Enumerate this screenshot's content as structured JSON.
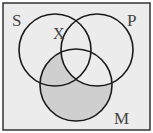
{
  "diagram": {
    "type": "venn",
    "sets": [
      {
        "label": "S",
        "cx": 55,
        "cy": 50,
        "r": 36
      },
      {
        "label": "P",
        "cx": 97,
        "cy": 50,
        "r": 36
      },
      {
        "label": "M",
        "cx": 76,
        "cy": 85,
        "r": 36
      }
    ],
    "labels": {
      "s": "S",
      "p": "P",
      "m": "M",
      "x": "X"
    },
    "shaded_region": "M minus P",
    "colors": {
      "background": "#ececec",
      "shade": "#cfcfcf",
      "stroke": "#1a1a1a",
      "frame": "#333333"
    }
  }
}
